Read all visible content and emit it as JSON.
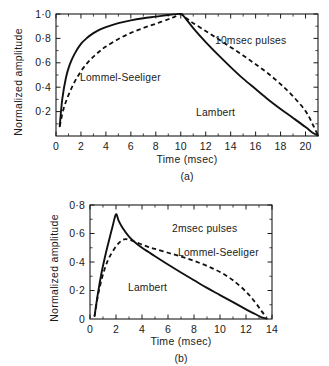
{
  "figure": {
    "name": "normalized-amplitude-vs-time",
    "panel_a_caption": "(a)",
    "panel_b_caption": "(b)"
  },
  "chart_data": [
    {
      "id": "panel-a",
      "type": "line",
      "title": "",
      "annotation": "10msec pulses",
      "xlabel": "Time (msec)",
      "ylabel": "Normalized amplitude",
      "xlim": [
        0,
        21
      ],
      "ylim": [
        0,
        1.0
      ],
      "xticks": [
        0,
        2,
        4,
        6,
        8,
        10,
        12,
        14,
        16,
        18,
        20
      ],
      "xticklabels": [
        "0",
        "2",
        "4",
        "6",
        "8",
        "10",
        "12",
        "14",
        "16",
        "18",
        "20"
      ],
      "yticks": [
        0.2,
        0.4,
        0.6,
        0.8,
        1.0
      ],
      "yticklabels": [
        "0·2",
        "0·4",
        "0·6",
        "0·8",
        "1·0"
      ],
      "minor_x_ticks": true,
      "minor_y_ticks": true,
      "grid": false,
      "legend": "inline-labels",
      "series": [
        {
          "name": "Lambert",
          "style": "solid",
          "label_position": "lower-right",
          "x": [
            0.3,
            0.5,
            0.8,
            1.1,
            1.5,
            2.0,
            2.5,
            3.0,
            3.5,
            4.0,
            5.0,
            6.0,
            7.0,
            8.0,
            9.0,
            9.5,
            10.0,
            10.3,
            11.0,
            12.0,
            13.0,
            14.0,
            15.0,
            16.0,
            17.0,
            18.0,
            19.0,
            20.0,
            20.6,
            21.0
          ],
          "y": [
            0.08,
            0.3,
            0.48,
            0.585,
            0.675,
            0.755,
            0.805,
            0.843,
            0.872,
            0.893,
            0.925,
            0.948,
            0.965,
            0.978,
            0.992,
            0.997,
            1.0,
            0.975,
            0.885,
            0.77,
            0.665,
            0.565,
            0.47,
            0.385,
            0.3,
            0.222,
            0.148,
            0.073,
            0.025,
            0.005
          ]
        },
        {
          "name": "Lommel-Seeliger",
          "style": "dashed",
          "label_position": "mid-left",
          "x": [
            0.3,
            0.6,
            1.0,
            1.5,
            2.0,
            2.5,
            3.0,
            3.5,
            4.0,
            5.0,
            6.0,
            7.0,
            8.0,
            9.0,
            9.5,
            10.0,
            10.4,
            11.0,
            12.0,
            13.0,
            14.0,
            15.0,
            16.0,
            17.0,
            18.0,
            19.0,
            20.0,
            20.6,
            21.0
          ],
          "y": [
            0.08,
            0.22,
            0.335,
            0.445,
            0.53,
            0.597,
            0.65,
            0.695,
            0.733,
            0.795,
            0.845,
            0.885,
            0.92,
            0.957,
            0.977,
            1.0,
            0.97,
            0.925,
            0.86,
            0.795,
            0.728,
            0.66,
            0.588,
            0.512,
            0.425,
            0.325,
            0.205,
            0.09,
            0.005
          ]
        }
      ]
    },
    {
      "id": "panel-b",
      "type": "line",
      "title": "",
      "annotation": "2msec pulses",
      "xlabel": "Time (msec)",
      "ylabel": "Normalized amplitude",
      "xlim": [
        0,
        14
      ],
      "ylim": [
        0,
        0.8
      ],
      "xticks": [
        0,
        2,
        4,
        6,
        8,
        10,
        12,
        14
      ],
      "xticklabels": [
        "0",
        "2",
        "4",
        "6",
        "8",
        "10",
        "12",
        "14"
      ],
      "yticks": [
        0.2,
        0.4,
        0.6,
        0.8
      ],
      "yticklabels": [
        "0·2",
        "0·4",
        "0·6",
        "0·8"
      ],
      "y_zero_label": "0",
      "minor_x_ticks": true,
      "minor_y_ticks": true,
      "grid": false,
      "legend": "inline-labels",
      "series": [
        {
          "name": "Lambert",
          "style": "solid",
          "label_position": "lower-left",
          "x": [
            0.35,
            0.6,
            0.9,
            1.2,
            1.5,
            1.75,
            2.0,
            2.2,
            2.5,
            3.0,
            3.5,
            4.0,
            4.5,
            5.0,
            6.0,
            7.0,
            8.0,
            9.0,
            10.0,
            11.0,
            12.0,
            12.7,
            13.2,
            13.6
          ],
          "y": [
            0.02,
            0.175,
            0.33,
            0.455,
            0.565,
            0.655,
            0.735,
            0.69,
            0.64,
            0.578,
            0.535,
            0.5,
            0.47,
            0.44,
            0.382,
            0.326,
            0.272,
            0.218,
            0.168,
            0.118,
            0.068,
            0.035,
            0.012,
            0.003
          ]
        },
        {
          "name": "Lommel-Seeliger",
          "style": "dashed",
          "label_position": "mid-right",
          "x": [
            0.35,
            0.6,
            0.9,
            1.2,
            1.5,
            2.0,
            2.4,
            2.7,
            3.0,
            3.5,
            4.0,
            4.5,
            5.0,
            6.0,
            7.0,
            8.0,
            9.0,
            10.0,
            11.0,
            12.0,
            12.7,
            13.2,
            13.6
          ],
          "y": [
            0.02,
            0.16,
            0.28,
            0.37,
            0.435,
            0.51,
            0.548,
            0.56,
            0.556,
            0.54,
            0.522,
            0.505,
            0.492,
            0.465,
            0.438,
            0.408,
            0.372,
            0.33,
            0.272,
            0.192,
            0.118,
            0.055,
            0.01
          ]
        }
      ]
    }
  ]
}
